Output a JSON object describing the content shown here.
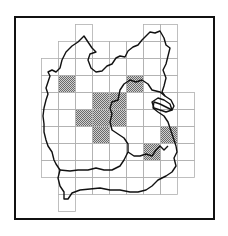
{
  "map": {
    "title": "",
    "frame_color": "#111111",
    "grid_color": "#b0b0b0",
    "outline_color": "#111111",
    "hatch_color": "#8a8a8a",
    "cell_size_px": 17,
    "grid_origin_px": [
      41,
      24
    ],
    "grid_rows": [
      {
        "row": 0,
        "cols": [
          2,
          6,
          7
        ]
      },
      {
        "row": 1,
        "cols": [
          1,
          2,
          3,
          4,
          5,
          6,
          7
        ]
      },
      {
        "row": 2,
        "cols": [
          0,
          1,
          2,
          3,
          4,
          5,
          6,
          7
        ]
      },
      {
        "row": 3,
        "cols": [
          0,
          1,
          2,
          3,
          4,
          5,
          6,
          7
        ]
      },
      {
        "row": 4,
        "cols": [
          0,
          1,
          2,
          3,
          4,
          5,
          6,
          7,
          8
        ]
      },
      {
        "row": 5,
        "cols": [
          0,
          1,
          2,
          3,
          4,
          5,
          6,
          7,
          8
        ]
      },
      {
        "row": 6,
        "cols": [
          0,
          1,
          2,
          3,
          4,
          5,
          6,
          7,
          8
        ]
      },
      {
        "row": 7,
        "cols": [
          0,
          1,
          2,
          3,
          4,
          5,
          6,
          7,
          8
        ]
      },
      {
        "row": 8,
        "cols": [
          0,
          1,
          2,
          3,
          4,
          5,
          6,
          7,
          8
        ]
      },
      {
        "row": 9,
        "cols": [
          1,
          2,
          3,
          4,
          5,
          6,
          7
        ]
      },
      {
        "row": 10,
        "cols": [
          1
        ]
      }
    ],
    "hatched_cells": [
      [
        1,
        3
      ],
      [
        5,
        3
      ],
      [
        3,
        4
      ],
      [
        4,
        4
      ],
      [
        2,
        5
      ],
      [
        3,
        5
      ],
      [
        4,
        5
      ],
      [
        3,
        6
      ],
      [
        7,
        6
      ],
      [
        6,
        7
      ]
    ],
    "legend": []
  }
}
